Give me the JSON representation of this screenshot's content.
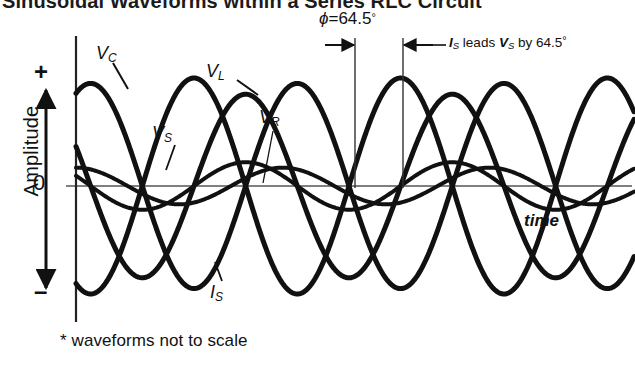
{
  "figure": {
    "heading": "Sinusoidal Waveforms within a Series RLC Circuit",
    "footnote": "* waveforms not to scale",
    "time_axis_label": "time",
    "amplitude_axis": {
      "label": "Amplitude",
      "plus": "+",
      "zero": "0",
      "minus": "–"
    },
    "phase_annotation": {
      "symbol": "ϕ",
      "equals": "=",
      "value": "64.5",
      "degree": "°",
      "full": "ϕ = 64.5°",
      "note_prefix": "I",
      "note_sub1": "S",
      "note_mid": " leads ",
      "note_v": "V",
      "note_sub2": "S",
      "note_suffix": " by 64.5",
      "note_degree": "°",
      "full_note": "IS leads VS by 64.5°"
    },
    "waveform_labels": [
      {
        "name": "V",
        "sub": "C",
        "id": "vc"
      },
      {
        "name": "V",
        "sub": "L",
        "id": "vl"
      },
      {
        "name": "V",
        "sub": "S",
        "id": "vs"
      },
      {
        "name": "V",
        "sub": "R",
        "id": "vr"
      },
      {
        "name": "I",
        "sub": "S",
        "id": "is"
      }
    ],
    "colors": {
      "ink": "#111111",
      "background": "#ffffff",
      "thin_rule": "#555555"
    }
  },
  "chart_data": {
    "type": "line",
    "title": "Sinusoidal Waveforms within a Series RLC Circuit",
    "xlabel": "time",
    "ylabel": "Amplitude",
    "grid": false,
    "legend": "inline-annotations",
    "xlim": [
      0,
      2.7
    ],
    "ylim": [
      -1.15,
      1.15
    ],
    "x_unit": "cycles",
    "ytick_labels": [
      "+",
      "0",
      "–"
    ],
    "phase_reference_deg": 64.5,
    "series": [
      {
        "name": "VC",
        "label": "V_C",
        "amplitude": 1.0,
        "phase_deg": -115.5,
        "stroke": 5.0,
        "description": "capacitor voltage, lags current by 90 degrees, largest amplitude"
      },
      {
        "name": "VL",
        "label": "V_L",
        "amplitude": 0.95,
        "phase_deg": 64.5,
        "stroke": 5.0,
        "description": "inductor voltage, leads current by 90 degrees"
      },
      {
        "name": "IS",
        "label": "I_S",
        "amplitude": 0.85,
        "phase_deg": 154.5,
        "stroke": 5.0,
        "description": "supply current, leads supply voltage by 64.5 degrees"
      },
      {
        "name": "VR",
        "label": "V_R",
        "amplitude": 0.22,
        "phase_deg": 154.5,
        "stroke": 4.0,
        "description": "resistor voltage, in phase with current, small amplitude"
      },
      {
        "name": "VS",
        "label": "V_S",
        "amplitude": 0.17,
        "phase_deg": 90.0,
        "stroke": 4.0,
        "description": "supply voltage, small amplitude, lags current by 64.5 degrees"
      }
    ],
    "annotations": [
      {
        "text": "ϕ = 64.5°",
        "type": "phase-span",
        "x_from": 1.0,
        "x_to": 1.18
      },
      {
        "text": "IS leads VS by 64.5°",
        "type": "note"
      },
      {
        "text": "* waveforms not to scale",
        "type": "footnote"
      }
    ]
  }
}
